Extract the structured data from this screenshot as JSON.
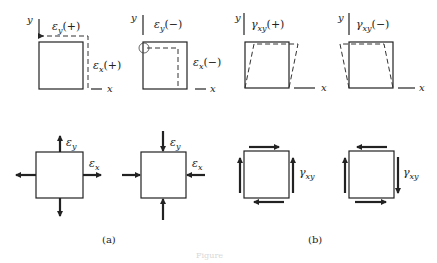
{
  "figure": {
    "panel_a": {
      "label": "(a)",
      "top_left": {
        "axis_y": "y",
        "axis_x": "x",
        "strain_y_label": "εy(+)",
        "strain_y_symbol": "ε",
        "strain_y_sub": "y",
        "strain_y_sign": "(+)",
        "strain_x_symbol": "ε",
        "strain_x_sub": "x",
        "strain_x_sign": "(+)"
      },
      "top_right": {
        "axis_y": "y",
        "axis_x": "x",
        "strain_y_symbol": "ε",
        "strain_y_sub": "y",
        "strain_y_sign": "(−)",
        "strain_x_symbol": "ε",
        "strain_x_sub": "x",
        "strain_x_sign": "(−)"
      },
      "bottom_left": {
        "label_y_symbol": "ε",
        "label_y_sub": "y",
        "label_x_symbol": "ε",
        "label_x_sub": "x",
        "state": "tension"
      },
      "bottom_right": {
        "label_y_symbol": "ε",
        "label_y_sub": "y",
        "label_x_symbol": "ε",
        "label_x_sub": "x",
        "state": "compression"
      }
    },
    "panel_b": {
      "label": "(b)",
      "top_left": {
        "axis_y": "y",
        "axis_x": "x",
        "shear_symbol": "γ",
        "shear_sub": "xy",
        "shear_sign": "(+)"
      },
      "top_right": {
        "axis_y": "y",
        "axis_x": "x",
        "shear_symbol": "γ",
        "shear_sub": "xy",
        "shear_sign": "(−)"
      },
      "bottom_left": {
        "shear_symbol": "γ",
        "shear_sub": "xy",
        "direction": "positive"
      },
      "bottom_right": {
        "shear_symbol": "γ",
        "shear_sub": "xy",
        "direction": "negative"
      }
    },
    "caption": "Figure"
  },
  "colors": {
    "line": "#222222",
    "dash": "#333333",
    "background": "#ffffff"
  }
}
